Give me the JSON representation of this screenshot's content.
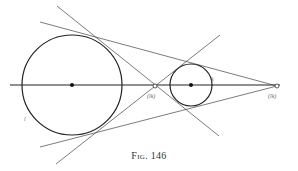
{
  "figure": {
    "caption": "Fig. 146",
    "colors": {
      "ink": "#222222",
      "background": "#ffffff",
      "label": "#666666"
    },
    "circles": [
      {
        "name": "large-circle",
        "label": "l",
        "cx": 72,
        "cy": 85,
        "r": 50
      },
      {
        "name": "small-circle",
        "label": "k",
        "cx": 191,
        "cy": 85,
        "r": 21
      }
    ],
    "axis": {
      "x1": 10,
      "y1": 85,
      "x2": 280,
      "y2": 85
    },
    "points": [
      {
        "name": "internal-center-of-similitude",
        "label": "(lk)",
        "x": 155,
        "y": 86
      },
      {
        "name": "external-center-of-similitude",
        "label": "(lk)",
        "x": 277,
        "y": 86
      }
    ],
    "labels": {
      "large_circle": "l",
      "small_circle": "k",
      "internal_point": "(lk)",
      "external_point": "(lk)"
    }
  }
}
